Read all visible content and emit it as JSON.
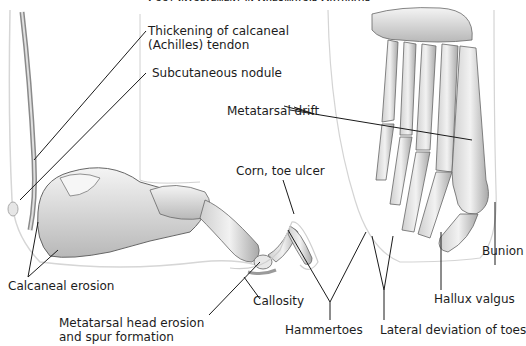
{
  "figure": {
    "title": "Foot Involvement in Rheumatoid Arthritis",
    "labels": {
      "thickening": [
        "Thickening of calcaneal",
        "(Achilles) tendon"
      ],
      "nodule": "Subcutaneous nodule",
      "metatarsal_drift": "Metatarsal drift",
      "corn": "Corn, toe ulcer",
      "calcaneal_erosion": "Calcaneal erosion",
      "metatarsal_head": [
        "Metatarsal head erosion",
        "and spur formation"
      ],
      "callosity": "Callosity",
      "hammertoes": "Hammertoes",
      "lateral_deviation": "Lateral deviation of toes",
      "hallux_valgus": "Hallux valgus",
      "bunion": "Bunion"
    },
    "colors": {
      "bone": "#e6e6e6",
      "bone_shade": "#9a9a9a",
      "outline": "#555555",
      "skin_outline": "#c8c8c8",
      "leader": "#1a1a1a"
    }
  }
}
